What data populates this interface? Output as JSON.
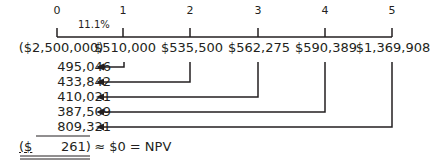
{
  "timeline": {
    "periods": [
      "0",
      "1",
      "2",
      "3",
      "4",
      "5"
    ],
    "rate_label": "11.1%",
    "cash_flows": [
      "($2,500,000)",
      "$510,000",
      "$535,500",
      "$562,275",
      "$590,389",
      "$1,369,908"
    ]
  },
  "present_values": [
    "495,046",
    "433,842",
    "410,021",
    "387,509",
    "809,321"
  ],
  "npv": {
    "currency": "($",
    "amount": "261)",
    "suffix": "≈ $0 = NPV"
  },
  "colors": {
    "ink": "#231f20"
  }
}
